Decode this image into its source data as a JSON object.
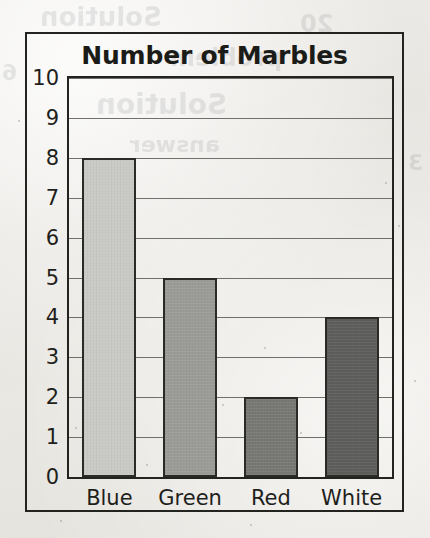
{
  "chart_data": {
    "type": "bar",
    "title": "Number of Marbles",
    "categories": [
      "Blue",
      "Green",
      "Red",
      "White"
    ],
    "values": [
      8,
      5,
      2,
      4
    ],
    "xlabel": "",
    "ylabel": "",
    "ylim": [
      0,
      10
    ],
    "ytick_labels": [
      "0",
      "1",
      "2",
      "3",
      "4",
      "5",
      "6",
      "7",
      "8",
      "9",
      "10"
    ],
    "ytick_values": [
      0,
      1,
      2,
      3,
      4,
      5,
      6,
      7,
      8,
      9,
      10
    ],
    "grid": true,
    "grid_axis": "y",
    "legend": false,
    "bar_colors": [
      "#c9c9c6",
      "#9a9a97",
      "#777774",
      "#5d5d5b"
    ],
    "bar_edge_color": "#2a2a27",
    "gridline_color": "#6f6f6c",
    "axis_color": "#23231f",
    "title_color": "#1b1b18",
    "background_color": "#e9e8e4"
  },
  "figure": {
    "frame_border_color": "#23231f",
    "bleed_through_text": [
      "Solution",
      "problem"
    ]
  }
}
